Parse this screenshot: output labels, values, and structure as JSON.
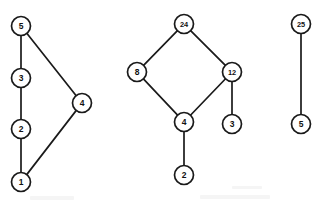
{
  "figure": {
    "width": 322,
    "height": 204,
    "background_color": "#ffffff",
    "node_stroke_color": "#1a1a1a",
    "node_fill_color": "#ffffff",
    "edge_color": "#1a1a1a",
    "node_radius": 9.5
  },
  "components": [
    {
      "id": "component-left",
      "name": "left-component",
      "nodes": [
        {
          "id": "L5",
          "label": "5",
          "cx": 21,
          "cy": 26
        },
        {
          "id": "L3",
          "label": "3",
          "cx": 21,
          "cy": 78
        },
        {
          "id": "L2",
          "label": "2",
          "cx": 21,
          "cy": 129
        },
        {
          "id": "L1",
          "label": "1",
          "cx": 21,
          "cy": 182
        },
        {
          "id": "L4",
          "label": "4",
          "cx": 82,
          "cy": 103
        }
      ],
      "edges": [
        {
          "id": "L5-L3",
          "from": "L5",
          "to": "L3"
        },
        {
          "id": "L3-L2",
          "from": "L3",
          "to": "L2"
        },
        {
          "id": "L2-L1",
          "from": "L2",
          "to": "L1"
        },
        {
          "id": "L5-L4",
          "from": "L5",
          "to": "L4"
        },
        {
          "id": "L4-L1",
          "from": "L4",
          "to": "L1"
        }
      ]
    },
    {
      "id": "component-middle",
      "name": "middle-component",
      "nodes": [
        {
          "id": "M24",
          "label": "24",
          "cx": 184,
          "cy": 24
        },
        {
          "id": "M8",
          "label": "8",
          "cx": 137,
          "cy": 72
        },
        {
          "id": "M12",
          "label": "12",
          "cx": 232,
          "cy": 72
        },
        {
          "id": "M4",
          "label": "4",
          "cx": 184,
          "cy": 122
        },
        {
          "id": "M3",
          "label": "3",
          "cx": 232,
          "cy": 124
        },
        {
          "id": "M2",
          "label": "2",
          "cx": 184,
          "cy": 175
        }
      ],
      "edges": [
        {
          "id": "M24-M8",
          "from": "M24",
          "to": "M8"
        },
        {
          "id": "M24-M12",
          "from": "M24",
          "to": "M12"
        },
        {
          "id": "M8-M4",
          "from": "M8",
          "to": "M4"
        },
        {
          "id": "M12-M4",
          "from": "M12",
          "to": "M4"
        },
        {
          "id": "M12-M3",
          "from": "M12",
          "to": "M3"
        },
        {
          "id": "M4-M2",
          "from": "M4",
          "to": "M2"
        }
      ]
    },
    {
      "id": "component-right",
      "name": "right-component",
      "nodes": [
        {
          "id": "R25",
          "label": "25",
          "cx": 301,
          "cy": 24
        },
        {
          "id": "R5",
          "label": "5",
          "cx": 301,
          "cy": 124
        }
      ],
      "edges": [
        {
          "id": "R25-R5",
          "from": "R25",
          "to": "R5"
        }
      ]
    }
  ]
}
